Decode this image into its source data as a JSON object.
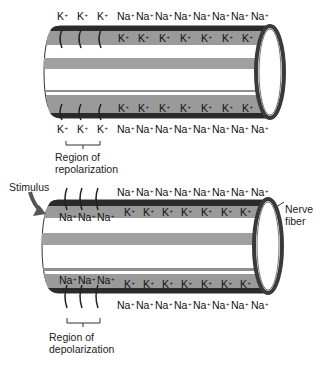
{
  "colors": {
    "membrane_dark": "#2a2a2a",
    "band_gray": "#9a9a9a",
    "lumen_white": "#ffffff",
    "outline": "#333333"
  },
  "top_panel": {
    "outside_top_ions": [
      "K",
      "K",
      "K",
      "Na",
      "Na",
      "Na",
      "Na",
      "Na",
      "Na",
      "Na",
      "Na"
    ],
    "inside_top_ions": [
      "K",
      "K",
      "K",
      "K",
      "K",
      "K",
      "K"
    ],
    "inside_bottom_ions": [
      "K",
      "K",
      "K",
      "K",
      "K",
      "K",
      "K"
    ],
    "outside_bottom_ions": [
      "K",
      "K",
      "K",
      "Na",
      "Na",
      "Na",
      "Na",
      "Na",
      "Na",
      "Na",
      "Na"
    ],
    "region_label_line1": "Region of",
    "region_label_line2": "repolarization"
  },
  "bottom_panel": {
    "stimulus_label": "Stimulus",
    "nerve_label_line1": "Nerve",
    "nerve_label_line2": "fiber",
    "outside_top_ions": [
      "Na",
      "Na",
      "Na",
      "Na",
      "Na",
      "Na",
      "Na",
      "Na"
    ],
    "inside_top_left_ions": [
      "Na",
      "Na",
      "Na"
    ],
    "inside_top_ions": [
      "K",
      "K",
      "K",
      "K",
      "K",
      "K",
      "K"
    ],
    "inside_bottom_left_ions": [
      "Na",
      "Na",
      "Na"
    ],
    "inside_bottom_ions": [
      "K",
      "K",
      "K",
      "K",
      "K",
      "K",
      "K"
    ],
    "outside_bottom_ions": [
      "Na",
      "Na",
      "Na",
      "Na",
      "Na",
      "Na",
      "Na",
      "Na"
    ],
    "region_label_line1": "Region of",
    "region_label_line2": "depolarization"
  },
  "charge": "+"
}
